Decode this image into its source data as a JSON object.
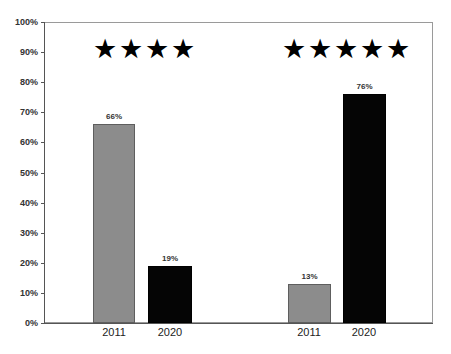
{
  "chart_data": {
    "type": "bar",
    "title": "",
    "xlabel": "",
    "ylabel": "",
    "ylim": [
      0,
      100
    ],
    "y_ticks": [
      "0%",
      "10%",
      "20%",
      "30%",
      "40%",
      "50%",
      "60%",
      "70%",
      "80%",
      "90%",
      "100%"
    ],
    "grid": false,
    "legend": null,
    "groups": [
      {
        "annotation": "★★★★",
        "rating_stars": 4,
        "categories": [
          "2011",
          "2020"
        ],
        "values": [
          66,
          19
        ],
        "labels": [
          "66%",
          "19%"
        ],
        "colors": [
          "#8c8c8c",
          "#050505"
        ]
      },
      {
        "annotation": "★★★★★",
        "rating_stars": 5,
        "categories": [
          "2011",
          "2020"
        ],
        "values": [
          13,
          76
        ],
        "labels": [
          "13%",
          "76%"
        ],
        "colors": [
          "#8c8c8c",
          "#050505"
        ]
      }
    ]
  }
}
